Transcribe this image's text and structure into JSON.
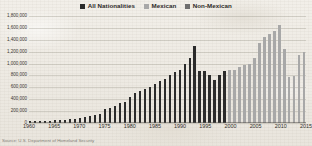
{
  "legend": {
    "items": [
      {
        "label": "All Nationalities",
        "color": "#2b2b2b",
        "icon": "square-swatch-icon"
      },
      {
        "label": "Mexican",
        "color": "#a8a8a8",
        "icon": "square-swatch-icon"
      },
      {
        "label": "Non-Mexican",
        "color": "#6e6e6e",
        "icon": "square-swatch-icon"
      }
    ]
  },
  "caption": "Source: U.S. Department of Homeland Security",
  "chart_data": {
    "type": "bar",
    "title": "",
    "xlabel": "",
    "ylabel": "",
    "ylim": [
      0,
      1800000
    ],
    "grid": true,
    "legend_position": "top-center",
    "y_ticks": [
      "1,800,000",
      "1,600,000",
      "1,400,000",
      "1,200,000",
      "1,000,000",
      "800,000",
      "600,000",
      "400,000",
      "200,000",
      "0"
    ],
    "y_tick_values": [
      1800000,
      1600000,
      1400000,
      1200000,
      1000000,
      800000,
      600000,
      400000,
      200000,
      0
    ],
    "x_tick_labels": [
      "1960",
      "1965",
      "1970",
      "1975",
      "1980",
      "1985",
      "1990",
      "1995",
      "2000",
      "2005",
      "2010",
      "2015"
    ],
    "categories": [
      "1960",
      "1961",
      "1962",
      "1963",
      "1964",
      "1965",
      "1966",
      "1967",
      "1968",
      "1969",
      "1970",
      "1971",
      "1972",
      "1973",
      "1974",
      "1975",
      "1976",
      "1977",
      "1978",
      "1979",
      "1980",
      "1981",
      "1982",
      "1983",
      "1984",
      "1985",
      "1986",
      "1987",
      "1988",
      "1989",
      "1990",
      "1991",
      "1992",
      "1993",
      "1994",
      "1995",
      "1996",
      "1997",
      "1998",
      "1999",
      "2000",
      "2001",
      "2002",
      "2003",
      "2004",
      "2005",
      "2006",
      "2007",
      "2008",
      "2009",
      "2010",
      "2011",
      "2012",
      "2013",
      "2014",
      "2015"
    ],
    "values": [
      30000,
      30000,
      30000,
      40000,
      42000,
      45000,
      50000,
      55000,
      62000,
      70000,
      80000,
      95000,
      110000,
      130000,
      160000,
      230000,
      250000,
      290000,
      330000,
      360000,
      440000,
      500000,
      540000,
      580000,
      600000,
      650000,
      700000,
      740000,
      800000,
      850000,
      900000,
      1000000,
      1100000,
      1300000,
      880000,
      880000,
      800000,
      720000,
      800000,
      880000,
      900000,
      900000,
      950000,
      980000,
      1000000,
      1100000,
      1350000,
      1450000,
      1500000,
      1550000,
      1650000,
      1250000,
      780000,
      790000,
      1150000,
      1200000
    ],
    "series_assignment": [
      "All Nationalities",
      "All Nationalities",
      "All Nationalities",
      "All Nationalities",
      "All Nationalities",
      "All Nationalities",
      "All Nationalities",
      "All Nationalities",
      "All Nationalities",
      "All Nationalities",
      "All Nationalities",
      "All Nationalities",
      "All Nationalities",
      "All Nationalities",
      "All Nationalities",
      "All Nationalities",
      "All Nationalities",
      "All Nationalities",
      "All Nationalities",
      "All Nationalities",
      "All Nationalities",
      "All Nationalities",
      "All Nationalities",
      "All Nationalities",
      "All Nationalities",
      "All Nationalities",
      "All Nationalities",
      "All Nationalities",
      "All Nationalities",
      "All Nationalities",
      "All Nationalities",
      "All Nationalities",
      "All Nationalities",
      "All Nationalities",
      "All Nationalities",
      "All Nationalities",
      "All Nationalities",
      "All Nationalities",
      "All Nationalities",
      "All Nationalities",
      "Mexican",
      "Mexican",
      "Mexican",
      "Mexican",
      "Mexican",
      "Mexican",
      "Mexican",
      "Mexican",
      "Mexican",
      "Mexican",
      "Mexican",
      "Mexican",
      "Mexican",
      "Mexican",
      "Mexican",
      "Mexican"
    ],
    "colors": {
      "All Nationalities": "#2b2b2b",
      "Mexican": "#a8a8a8",
      "Non-Mexican": "#6e6e6e"
    }
  }
}
